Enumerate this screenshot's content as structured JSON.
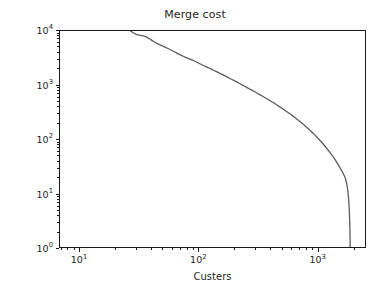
{
  "chart_data": {
    "type": "line",
    "title": "Merge cost",
    "xlabel": "Custers",
    "ylabel": "",
    "xscale": "log",
    "yscale": "log",
    "xlim": [
      6.8,
      2540
    ],
    "ylim": [
      1,
      10000
    ],
    "grid": false,
    "legend": null,
    "line_color": "#5a5a5a",
    "line_width": 1.3,
    "xticks": [
      10,
      100,
      1000
    ],
    "xtick_labels": [
      "10¹",
      "10²",
      "10³"
    ],
    "yticks": [
      1,
      10,
      100,
      1000,
      10000
    ],
    "ytick_labels": [
      "10⁰",
      "10¹",
      "10²",
      "10³",
      "10⁴"
    ],
    "x": [
      7.0,
      7.4,
      7.8,
      8.2,
      8.6,
      9.0,
      9.4,
      9.9,
      10.4,
      10.9,
      11.4,
      12.0,
      12.6,
      13.2,
      13.9,
      14.6,
      15.3,
      16.1,
      16.9,
      17.7,
      18.6,
      19.5,
      20.5,
      21.5,
      22.6,
      23.7,
      24.9,
      26.1,
      27.4,
      28.8,
      30.2,
      31.7,
      33.3,
      35.0,
      36.7,
      38.6,
      40.5,
      42.5,
      44.6,
      46.8,
      49.2,
      51.6,
      54.2,
      56.9,
      59.7,
      62.7,
      65.8,
      69.1,
      72.5,
      76.1,
      79.9,
      83.9,
      88.1,
      92.5,
      97.1,
      102.0,
      107.0,
      112.4,
      118.0,
      123.9,
      130.1,
      136.6,
      143.4,
      150.6,
      158.1,
      166.0,
      174.3,
      183.0,
      192.2,
      201.8,
      211.9,
      222.5,
      233.6,
      245.3,
      257.5,
      270.4,
      283.9,
      298.1,
      313.0,
      328.7,
      345.1,
      362.4,
      380.5,
      399.5,
      419.5,
      440.4,
      462.5,
      485.6,
      509.9,
      535.4,
      562.2,
      590.3,
      619.8,
      650.8,
      683.3,
      717.5,
      753.3,
      791.0,
      830.6,
      872.1,
      915.7,
      961.5,
      1009.6,
      1060.1,
      1113.1,
      1168.7,
      1227.2,
      1288.5,
      1353.0,
      1420.6,
      1491.6,
      1566.2,
      1644.5,
      1726.8,
      1780.0,
      1820.0,
      1850.0,
      1875.0,
      1895.0,
      1905.0
    ],
    "y": [
      60000,
      52000,
      46000,
      41000,
      36000,
      32500,
      30000,
      28300,
      27600,
      27300,
      24500,
      23600,
      23100,
      22600,
      22000,
      21200,
      20100,
      18900,
      17600,
      16300,
      15000,
      13900,
      13000,
      12300,
      11800,
      11400,
      11000,
      10400,
      9700,
      9000,
      8600,
      8350,
      8200,
      8050,
      7700,
      7200,
      6700,
      6250,
      5900,
      5600,
      5350,
      5100,
      4850,
      4600,
      4350,
      4120,
      3900,
      3700,
      3500,
      3330,
      3180,
      3050,
      2920,
      2780,
      2640,
      2500,
      2370,
      2250,
      2140,
      2040,
      1940,
      1840,
      1745,
      1655,
      1570,
      1490,
      1410,
      1335,
      1265,
      1195,
      1130,
      1065,
      1005,
      950,
      895,
      845,
      795,
      750,
      705,
      665,
      625,
      587,
      551,
      517,
      484,
      453,
      423,
      394,
      367,
      341,
      316,
      293,
      271,
      250,
      230,
      211,
      193,
      176,
      160,
      145,
      131,
      118,
      105.5,
      94,
      83.5,
      73.5,
      64.5,
      56.0,
      48.5,
      41.5,
      35.0,
      29.2,
      24.0,
      19.3,
      15.0,
      11.0,
      7.5,
      4.6,
      2.3,
      1.0
    ]
  }
}
